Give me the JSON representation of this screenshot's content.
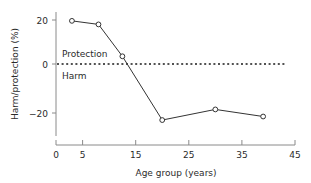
{
  "chart_data": {
    "type": "line",
    "title": "",
    "xlabel": "Age group (years)",
    "ylabel": "Harm/protection (%)",
    "xlim": [
      0,
      45
    ],
    "ylim": [
      -40,
      30
    ],
    "xticks": [
      0,
      5,
      15,
      25,
      35,
      45
    ],
    "xtick_labels": [
      "0",
      "5",
      "15",
      "25",
      "35",
      "45"
    ],
    "yticks": [
      20,
      0,
      -20
    ],
    "ytick_labels": [
      "20",
      "0",
      "−20"
    ],
    "grid": false,
    "legend": "none",
    "x": [
      3,
      8,
      12.5,
      20,
      30,
      39
    ],
    "values": [
      25,
      23,
      5,
      -31,
      -25,
      -29
    ],
    "series": [
      {
        "name": "Harm/protection",
        "x": [
          3,
          8,
          12.5,
          20,
          30,
          39
        ],
        "values": [
          25,
          23,
          5,
          -31,
          -25,
          -29
        ]
      }
    ],
    "reference_line": {
      "y": 0,
      "style": "dotted"
    },
    "annotations": [
      {
        "text": "Protection",
        "x": 5,
        "y": 9
      },
      {
        "text": "Harm",
        "x": 5,
        "y": -8
      }
    ],
    "colors": {
      "line": "#333333",
      "marker_face": "#ffffff",
      "marker_edge": "#333333",
      "zero_line": "#1a1a1a",
      "axis": "#8a8a8a",
      "text": "#2b2b2b",
      "background": "#ffffff"
    }
  }
}
